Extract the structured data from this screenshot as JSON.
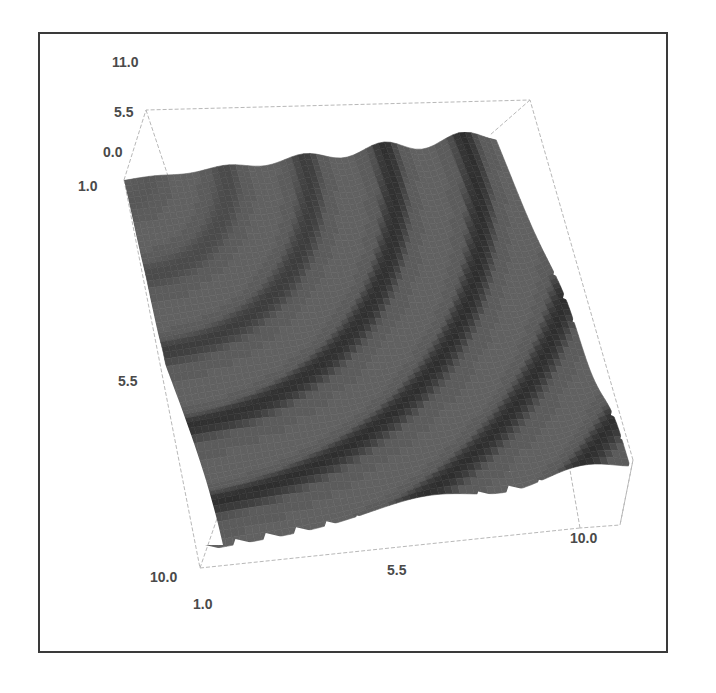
{
  "chart_data": {
    "type": "surface3d",
    "title": "",
    "x": {
      "label": "",
      "ticks": [
        "1.0",
        "5.5",
        "10.0"
      ],
      "range": [
        1.0,
        10.0
      ]
    },
    "y": {
      "label": "",
      "ticks": [
        "1.0",
        "5.5",
        "10.0"
      ],
      "range": [
        1.0,
        10.0
      ]
    },
    "z": {
      "label": "",
      "ticks": [
        "0.0",
        "5.5",
        "11.0"
      ],
      "range": [
        0.0,
        11.0
      ]
    },
    "surface": {
      "function_hint": "z ≈ sin(r) ripple, r = distance from (1,1)",
      "ripple_bands": 12,
      "color": "#5e5e5e",
      "dark_band_color": "#2e2e2e"
    },
    "bounding_box": true,
    "grid": false,
    "legend": null
  },
  "labels": {
    "z_top": "11.0",
    "z_mid": "5.5",
    "z_zero": "0.0",
    "y_start": "1.0",
    "y_mid": "5.5",
    "y_end": "10.0",
    "x_start": "1.0",
    "x_mid": "5.5",
    "x_end": "10.0"
  }
}
